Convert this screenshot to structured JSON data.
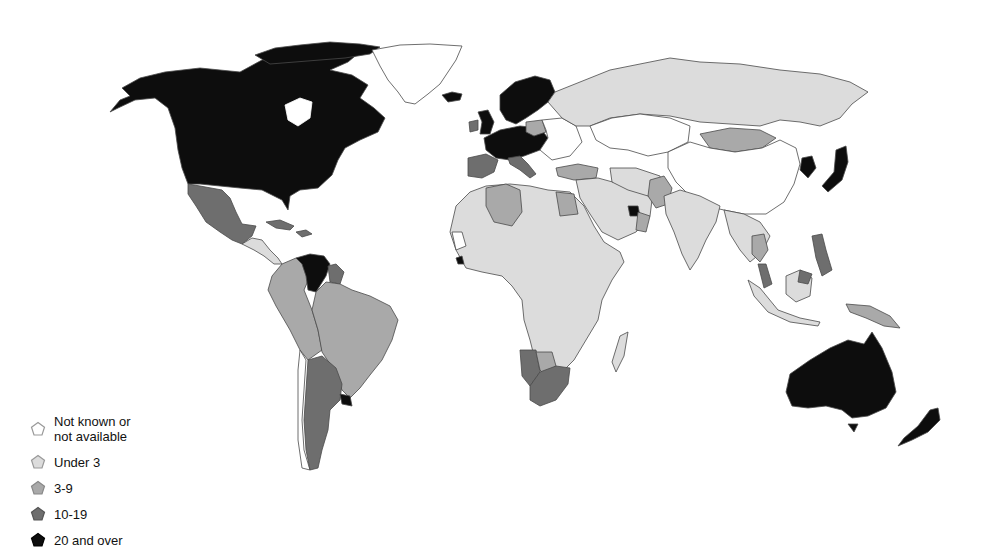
{
  "legend": {
    "items": [
      {
        "label": "Not known or\nnot available",
        "category": "na",
        "color": "#ffffff",
        "icon": "pentagon-icon"
      },
      {
        "label": "Under 3",
        "category": "under3",
        "color": "#dcdcdc",
        "icon": "pentagon-icon"
      },
      {
        "label": "3-9",
        "category": "3to9",
        "color": "#a9a9a9",
        "icon": "pentagon-icon"
      },
      {
        "label": "10-19",
        "category": "10to19",
        "color": "#6e6e6e",
        "icon": "pentagon-icon"
      },
      {
        "label": "20 and over",
        "category": "20plus",
        "color": "#0d0d0d",
        "icon": "pentagon-icon"
      }
    ]
  },
  "colors": {
    "na": "#ffffff",
    "under3": "#dcdcdc",
    "3to9": "#a9a9a9",
    "10to19": "#6e6e6e",
    "20plus": "#0d0d0d",
    "border": "#4a4a4a",
    "background": "#ffffff"
  },
  "regions": [
    {
      "name": "North America (USA/Canada/Alaska)",
      "category": "20plus"
    },
    {
      "name": "Greenland",
      "category": "na"
    },
    {
      "name": "Iceland",
      "category": "20plus"
    },
    {
      "name": "Mexico",
      "category": "10to19"
    },
    {
      "name": "Central America",
      "category": "under3"
    },
    {
      "name": "Caribbean",
      "category": "10to19"
    },
    {
      "name": "Venezuela",
      "category": "20plus"
    },
    {
      "name": "Guyana/Suriname",
      "category": "10to19"
    },
    {
      "name": "Colombia/Ecuador/Peru/Bolivia/Paraguay",
      "category": "3to9"
    },
    {
      "name": "Brazil",
      "category": "3to9"
    },
    {
      "name": "Argentina",
      "category": "10to19"
    },
    {
      "name": "Chile",
      "category": "na"
    },
    {
      "name": "Uruguay",
      "category": "20plus"
    },
    {
      "name": "Western/Northern Europe",
      "category": "20plus"
    },
    {
      "name": "Spain/Italy",
      "category": "10to19"
    },
    {
      "name": "Poland/Turkey",
      "category": "3to9"
    },
    {
      "name": "Eastern Europe",
      "category": "na"
    },
    {
      "name": "Russia",
      "category": "under3"
    },
    {
      "name": "Central Asia",
      "category": "na"
    },
    {
      "name": "China",
      "category": "na"
    },
    {
      "name": "Mongolia",
      "category": "3to9"
    },
    {
      "name": "Japan/South Korea",
      "category": "20plus"
    },
    {
      "name": "Middle East",
      "category": "under3"
    },
    {
      "name": "UAE",
      "category": "20plus"
    },
    {
      "name": "Oman",
      "category": "3to9"
    },
    {
      "name": "Pakistan",
      "category": "3to9"
    },
    {
      "name": "India",
      "category": "under3"
    },
    {
      "name": "Southeast Asia",
      "category": "under3"
    },
    {
      "name": "Thailand",
      "category": "3to9"
    },
    {
      "name": "Philippines",
      "category": "10to19"
    },
    {
      "name": "Malaysia",
      "category": "10to19"
    },
    {
      "name": "Papua New Guinea",
      "category": "3to9"
    },
    {
      "name": "Algeria/Egypt",
      "category": "3to9"
    },
    {
      "name": "Africa (most)",
      "category": "under3"
    },
    {
      "name": "Namibia/South Africa",
      "category": "10to19"
    },
    {
      "name": "Botswana",
      "category": "3to9"
    },
    {
      "name": "Liberia",
      "category": "20plus"
    },
    {
      "name": "Madagascar",
      "category": "under3"
    },
    {
      "name": "Australia",
      "category": "20plus"
    },
    {
      "name": "New Zealand",
      "category": "20plus"
    }
  ]
}
